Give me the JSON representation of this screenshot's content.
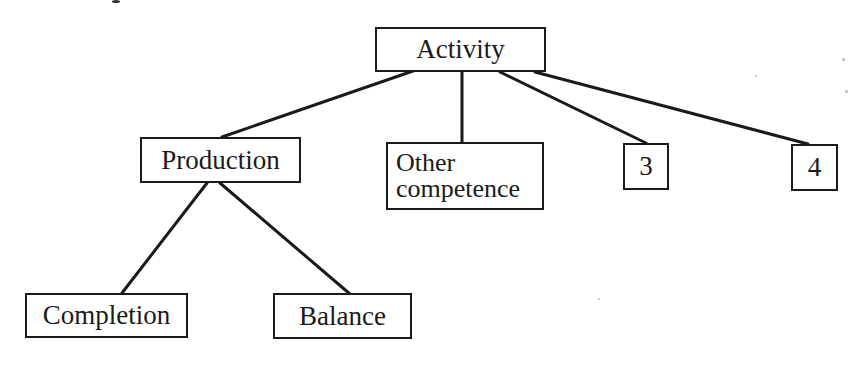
{
  "diagram": {
    "type": "tree",
    "root": {
      "label": "Activity",
      "children": [
        {
          "label": "Production",
          "children": [
            {
              "label": "Completion"
            },
            {
              "label": "Balance"
            }
          ]
        },
        {
          "label_lines": [
            "Other",
            "competence"
          ]
        },
        {
          "label": "3"
        },
        {
          "label": "4"
        }
      ]
    }
  },
  "colors": {
    "ink": "#1a1a1a",
    "background": "#ffffff"
  }
}
